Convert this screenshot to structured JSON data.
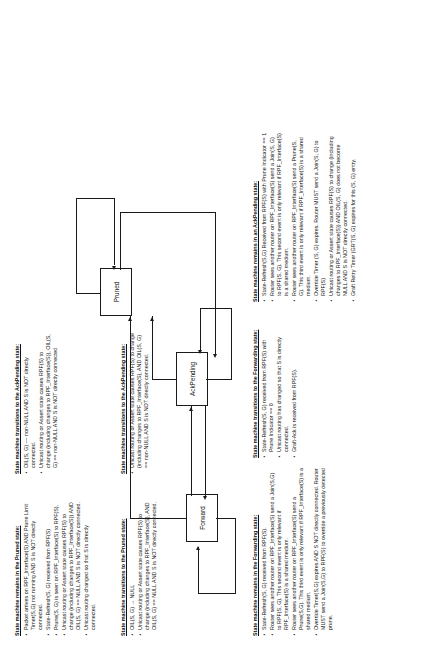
{
  "diagram": {
    "states": [
      {
        "id": "pruned",
        "label": "Pruned"
      },
      {
        "id": "forward",
        "label": "Forward"
      },
      {
        "id": "ackpending",
        "label": "AckPending"
      }
    ]
  },
  "blocks": {
    "pruned_remains": {
      "heading": "State machine remains in the Pruned state:",
      "items": [
        "Packet arrives on RPF_Interface(S) AND Prune Limit Timer(S,G) not running AND S is NOT directly connected.",
        "State-Refresh(S, G) received from RPF(S)",
        "Prune(S, G) is seen on RPF_Interface(S) to RPF(S).",
        "Unicast routing or Assert state causes RPF(S) to change (including changes to RPF_Interface(S)) AND OIL(S, G) == NULL AND S is NOT directly connected.",
        "Unicast routing changed so that S is directly connected."
      ]
    },
    "pruned_to_ackpending": {
      "heading": "State machine transitions to the AckPending state:",
      "items": [
        "OIL(S, G) –– non-NULL AND S is NOT directly connected.",
        "Unicast routing or Assert state causes RPF(S) to change (including changes to RPF_Interface(S)), OIL(S, G) == non-NULL AND S is NOT directly connected"
      ]
    },
    "ackpending_to_pruned": {
      "heading": "State machine transitions to the Pruned state:",
      "items": [
        "OIL(S, G) → NULL",
        "Unicast routing or Assert state causes RPF(S) to change (including changes to RPF_Interface(S), AND OIL(S, G) == NULL AND S is NOT directly connected."
      ]
    },
    "forward_to_ackpending": {
      "heading": "State machine transitions to the AckPending state:",
      "items": [
        "Unicast routing or Assert state causes RPF(S) to change (including changes to RPF_Interface(S), AND OIL(S, G) == non-NULL AND S is NOT directly connected."
      ]
    },
    "forward_remains": {
      "heading": "State machine remains in the Forwarding state:",
      "items": [
        "State-Refresh(S, G) received from RPF(S).",
        "Router sees another router on RPF_Interface(S) send a Join(S,G) to RPF(S, G). This second event is only relevant if RPF_Interface(S) is a shared medium.",
        "Router sees another router on RPF_Interface(S) send a Prune(S,G). This third event is only relevant if RPF_Interface(S) is a shared medium.",
        "Override Timer(S,G) expires AND S NOT directly connected. Router MUST send a Join(S,G) to RPF(S) to override a previously detected prune."
      ]
    },
    "ackpending_to_forwarding": {
      "heading": "State machine transitions to the Forwarding state:",
      "items": [
        "State-Refresh(S, G) received from RPF(S) with Prune Indicator == 0",
        "Unicast routing has changed so that S is directly connected.",
        "Graft-Ack is received from RPF(S)."
      ]
    },
    "ackpending_remains": {
      "heading": "State machine remains in an AckPending state:",
      "items": [
        "State-Refresh(S,G) Received from RPF(S) with Prune Indicator == 1",
        "Router sees another router on RPF_Interface(S) send a Join(S, G) to RPF(S, G). This second event is only relevant if RPF_Interface(S) is a shared medium.",
        "Router sees another router on RPF_Interface(S) send a Prune(S, G). This third event is only relevant if RPF_Interface(S) is a shared medium.",
        "Override Timer (S, G) expires. Router MUST send a Join(S, G) to RPF(S)",
        "Unicast routing or Assert state causes RPF(S) to change (including changes to RPF_Interface(S)) AND OIL(S, G) does not become NULL AND S is NOT directly connected.",
        "Graft Retry Timer (GRT(S, G) expires for this (S, G) entry."
      ]
    }
  }
}
